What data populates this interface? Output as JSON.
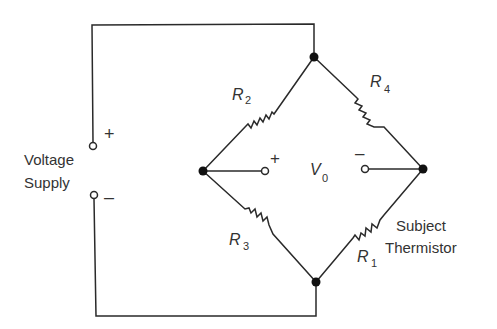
{
  "diagram": {
    "type": "wheatstone-bridge",
    "supply": {
      "label_line1": "Voltage",
      "label_line2": "Supply",
      "plus": "+",
      "minus": "–"
    },
    "output": {
      "label": "V",
      "subscript": "0",
      "plus": "+",
      "minus": "–"
    },
    "resistors": [
      {
        "id": "R2",
        "letter": "R",
        "subscript": "2",
        "position": "upper-left arm"
      },
      {
        "id": "R4",
        "letter": "R",
        "subscript": "4",
        "position": "upper-right arm"
      },
      {
        "id": "R3",
        "letter": "R",
        "subscript": "3",
        "position": "lower-left arm"
      },
      {
        "id": "R1",
        "letter": "R",
        "subscript": "1",
        "position": "lower-right arm"
      }
    ],
    "thermistor_label_line1": "Subject",
    "thermistor_label_line2": "Thermistor",
    "colors": {
      "line": "#2a2a2a",
      "text": "#333333",
      "background": "#ffffff"
    }
  }
}
